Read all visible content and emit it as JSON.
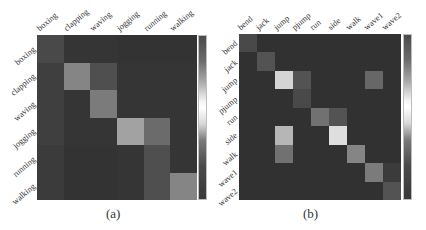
{
  "chart_data": [
    {
      "type": "heatmap",
      "title": "",
      "caption": "(a)",
      "x_tick_labels": [
        "boxing",
        "clapping",
        "waving",
        "jogging",
        "running",
        "walking"
      ],
      "y_tick_labels": [
        "boxing",
        "clapping",
        "waving",
        "jogging",
        "running",
        "walking"
      ],
      "values": [
        [
          0.15,
          0.05,
          0.05,
          0.04,
          0.04,
          0.04
        ],
        [
          0.1,
          0.45,
          0.18,
          0.05,
          0.05,
          0.05
        ],
        [
          0.1,
          0.05,
          0.4,
          0.05,
          0.05,
          0.05
        ],
        [
          0.1,
          0.05,
          0.05,
          0.6,
          0.32,
          0.05
        ],
        [
          0.08,
          0.04,
          0.04,
          0.05,
          0.18,
          0.05
        ],
        [
          0.08,
          0.04,
          0.04,
          0.05,
          0.18,
          0.45
        ]
      ],
      "colorbar": true,
      "colormap": "grayscale (dark-light-dark)"
    },
    {
      "type": "heatmap",
      "title": "",
      "caption": "(b)",
      "x_tick_labels": [
        "bend",
        "jack",
        "jump",
        "pjump",
        "run",
        "side",
        "walk",
        "wave1",
        "wave2"
      ],
      "y_tick_labels": [
        "bend",
        "jack",
        "jump",
        "pjump",
        "run",
        "side",
        "walk",
        "wave1",
        "wave2"
      ],
      "values": [
        [
          0.15,
          0.03,
          0.03,
          0.03,
          0.03,
          0.03,
          0.03,
          0.03,
          0.03
        ],
        [
          0.03,
          0.2,
          0.03,
          0.03,
          0.03,
          0.03,
          0.03,
          0.03,
          0.03
        ],
        [
          0.03,
          0.03,
          0.85,
          0.2,
          0.03,
          0.03,
          0.03,
          0.3,
          0.03
        ],
        [
          0.03,
          0.03,
          0.03,
          0.15,
          0.03,
          0.03,
          0.03,
          0.03,
          0.03
        ],
        [
          0.03,
          0.03,
          0.03,
          0.03,
          0.35,
          0.2,
          0.03,
          0.03,
          0.03
        ],
        [
          0.03,
          0.03,
          0.7,
          0.03,
          0.03,
          0.9,
          0.03,
          0.03,
          0.03
        ],
        [
          0.03,
          0.03,
          0.35,
          0.03,
          0.03,
          0.03,
          0.45,
          0.03,
          0.03
        ],
        [
          0.03,
          0.03,
          0.03,
          0.03,
          0.03,
          0.03,
          0.03,
          0.4,
          0.08
        ],
        [
          0.03,
          0.03,
          0.03,
          0.03,
          0.03,
          0.03,
          0.03,
          0.03,
          0.2
        ]
      ],
      "colorbar": true,
      "colormap": "grayscale (dark-light-dark)"
    }
  ],
  "panels": {
    "a": {
      "caption": "(a)"
    },
    "b": {
      "caption": "(b)"
    }
  }
}
